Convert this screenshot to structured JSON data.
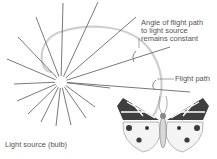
{
  "diagram": {
    "labels": {
      "angle_line1": "Angle of flight path",
      "angle_line2": "to light source",
      "angle_line3": "remains constant",
      "flight_path": "Flight path",
      "light_source": "Light source (bulb)"
    },
    "elements": {
      "light_source_icon": "radiating-bulb",
      "flight_path_icon": "spiral-path",
      "moth_icon": "moth-illustration",
      "angle_icon": "angle-arc"
    },
    "colors": {
      "rays": "#6a6a6a",
      "flight_path": "#cfcfcf",
      "text": "#555555",
      "moth_dark": "#3a3a3a"
    }
  }
}
